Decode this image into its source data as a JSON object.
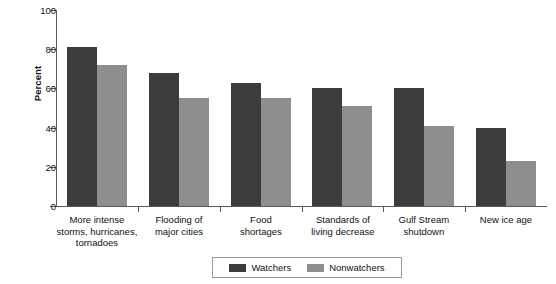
{
  "chart_data": {
    "type": "bar",
    "title": "",
    "subtitle": "",
    "xlabel": "",
    "ylabel": "Percent",
    "ylim": [
      0,
      100
    ],
    "yticks": [
      0,
      20,
      40,
      60,
      80,
      100
    ],
    "grid": false,
    "legend_position": "bottom",
    "categories": [
      "More intense storms, hurricanes, tornadoes",
      "Flooding of major cities",
      "Food shortages",
      "Standards of living decrease",
      "Gulf Stream shutdown",
      "New ice age"
    ],
    "category_lines": [
      [
        "More intense",
        "storms, hurricanes,",
        "tornadoes"
      ],
      [
        "Flooding of",
        "major cities"
      ],
      [
        "Food",
        "shortages"
      ],
      [
        "Standards of",
        "living decrease"
      ],
      [
        "Gulf Stream",
        "shutdown"
      ],
      [
        "New ice age"
      ]
    ],
    "series": [
      {
        "name": "Watchers",
        "color": "#3c3c3c",
        "values": [
          81,
          68,
          63,
          60,
          60,
          40
        ]
      },
      {
        "name": "Nonwatchers",
        "color": "#8e8e8e",
        "values": [
          72,
          55,
          55,
          51,
          41,
          23
        ]
      }
    ]
  },
  "axis": {
    "y_tick_labels": [
      "0",
      "20",
      "40",
      "60",
      "80",
      "100"
    ],
    "y_title": "Percent"
  },
  "legend": {
    "entries": [
      {
        "label": "Watchers",
        "swatch": "legend-swatch-watchers"
      },
      {
        "label": "Nonwatchers",
        "swatch": "legend-swatch-nonwatchers"
      }
    ]
  },
  "colors": {
    "watchers": "#3c3c3c",
    "nonwatchers": "#8e8e8e",
    "axis": "#5a5a5a",
    "text": "#111111",
    "background": "#ffffff"
  }
}
